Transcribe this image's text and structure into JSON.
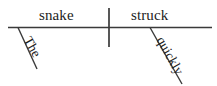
{
  "diagram": {
    "type": "reed-kellogg-sentence-diagram",
    "sentence": "The snake struck quickly.",
    "background_color": "#ffffff",
    "line_color": "#3a3a3a",
    "text_color": "#1c1c1c",
    "baseline": {
      "x1": 8,
      "y1": 27.5,
      "x2": 212,
      "y2": 27.5
    },
    "divider": {
      "x1": 109,
      "y1": 8,
      "x2": 109,
      "y2": 47
    },
    "words": {
      "subject": "snake",
      "verb": "struck",
      "article": "The",
      "adverb": "quickly"
    },
    "modifier_lines": [
      {
        "name": "article-slant",
        "x1": 18,
        "y1": 27.5,
        "x2": 37,
        "y2": 69
      },
      {
        "name": "adverb-slant",
        "x1": 150,
        "y1": 27.5,
        "x2": 182,
        "y2": 84
      }
    ]
  }
}
